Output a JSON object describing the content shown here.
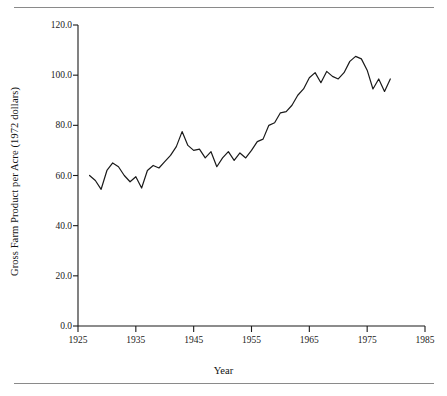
{
  "chart_data": {
    "type": "line",
    "title": "",
    "xlabel": "Year",
    "ylabel": "Gross Farm Product per Acre (1972 dollars)",
    "xlim": [
      1925,
      1985
    ],
    "ylim": [
      0.0,
      120.0
    ],
    "grid": false,
    "legend": null,
    "xticks": [
      1925,
      1935,
      1945,
      1955,
      1965,
      1975,
      1985
    ],
    "xtick_labels": [
      "1925",
      "1935",
      "1945",
      "1955",
      "1965",
      "1975",
      "1985"
    ],
    "yticks": [
      0.0,
      20.0,
      40.0,
      60.0,
      80.0,
      100.0,
      120.0
    ],
    "ytick_labels": [
      "0.0",
      "20.0",
      "40.0",
      "60.0",
      "80.0",
      "100.0",
      "120.0"
    ],
    "line_color": "#1a1a1a",
    "line_width": 1.2,
    "series": [
      {
        "name": "Gross Farm Product per Acre",
        "x": [
          1927,
          1928,
          1929,
          1930,
          1931,
          1932,
          1933,
          1934,
          1935,
          1936,
          1937,
          1938,
          1939,
          1940,
          1941,
          1942,
          1943,
          1944,
          1945,
          1946,
          1947,
          1948,
          1949,
          1950,
          1951,
          1952,
          1953,
          1954,
          1955,
          1956,
          1957,
          1958,
          1959,
          1960,
          1961,
          1962,
          1963,
          1964,
          1965,
          1966,
          1967,
          1968,
          1969,
          1970,
          1971,
          1972,
          1973,
          1974,
          1975,
          1976,
          1977,
          1978,
          1979
        ],
        "y": [
          60.0,
          58.0,
          54.5,
          62.0,
          65.0,
          63.5,
          60.0,
          57.5,
          59.5,
          55.0,
          62.0,
          64.0,
          63.0,
          65.5,
          68.0,
          71.5,
          77.5,
          72.0,
          70.0,
          70.5,
          67.0,
          69.5,
          63.5,
          67.0,
          69.5,
          66.0,
          69.0,
          67.0,
          70.0,
          73.5,
          74.5,
          80.0,
          81.0,
          85.0,
          85.5,
          88.0,
          92.0,
          94.5,
          99.0,
          101.0,
          97.0,
          101.5,
          99.5,
          98.5,
          101.0,
          105.5,
          107.5,
          106.5,
          102.0,
          94.5,
          98.5,
          93.5,
          98.5
        ]
      }
    ]
  },
  "figure": {
    "top_rule": "horizontal-rule",
    "bottom_rule": "horizontal-rule"
  }
}
